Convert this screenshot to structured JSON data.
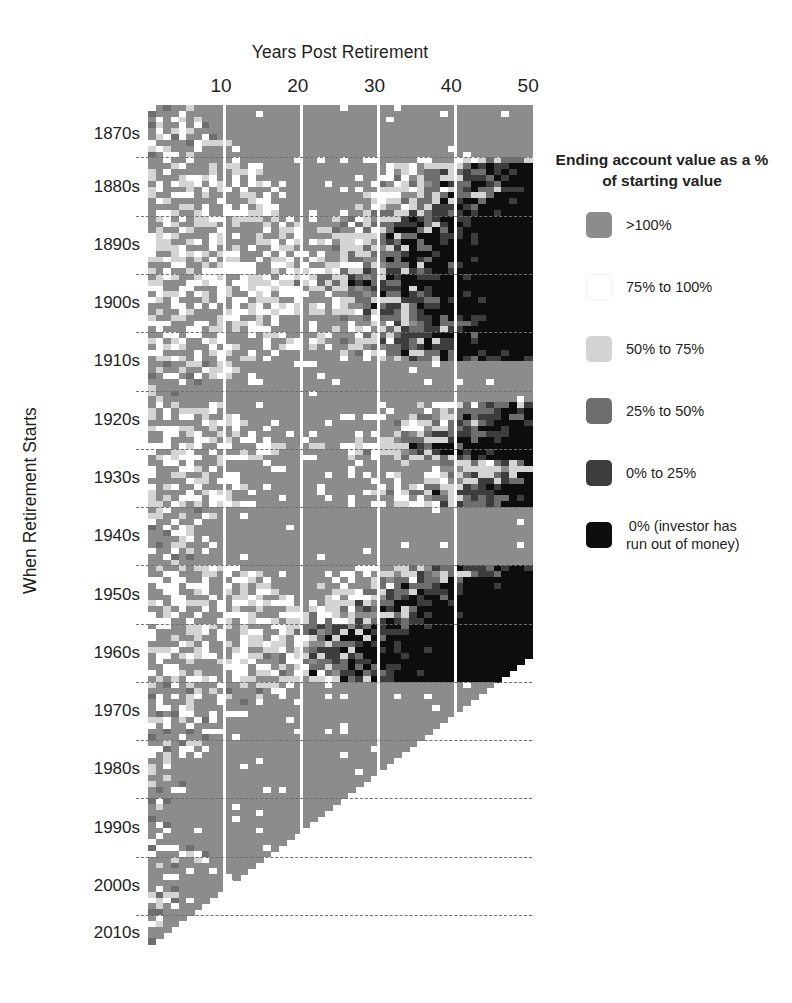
{
  "chart_data": {
    "type": "heatmap",
    "title": "",
    "xlabel": "Years Post Retirement",
    "ylabel": "When Retirement Starts",
    "xticks": [
      10,
      20,
      30,
      40,
      50
    ],
    "xlim": [
      1,
      50
    ],
    "ylim": [
      "1871",
      "2015"
    ],
    "grid": "vertical white separators every 10 years; horizontal dashed separators every decade",
    "legend_position": "right",
    "x_values_label": "Years post retirement (1 to 50)",
    "y_values_label": "Retirement start year (1871 to 2015), grouped by decade",
    "colors": {
      "gt100": "#8c8c8c",
      "p75_100": "#ffffff",
      "p50_75": "#d4d4d4",
      "p25_50": "#6e6e6e",
      "p0_25": "#3d3d3d",
      "zero": "#0d0d0d",
      "nodata": "#ffffff"
    },
    "bins": [
      {
        "key": "gt100",
        "label": ">100%",
        "color": "#8c8c8c"
      },
      {
        "key": "p75_100",
        "label": "75% to 100%",
        "color": "#ffffff"
      },
      {
        "key": "p50_75",
        "label": "50% to 75%",
        "color": "#d4d4d4"
      },
      {
        "key": "p25_50",
        "label": "25% to 50%",
        "color": "#6e6e6e"
      },
      {
        "key": "p0_25",
        "label": "0% to 25%",
        "color": "#3d3d3d"
      },
      {
        "key": "zero",
        "label": "0% (investor has\nrun out of money)",
        "color": "#0d0d0d"
      }
    ],
    "decades": [
      {
        "label": "1870s",
        "start": 1871
      },
      {
        "label": "1880s",
        "start": 1880
      },
      {
        "label": "1890s",
        "start": 1890
      },
      {
        "label": "1900s",
        "start": 1900
      },
      {
        "label": "1910s",
        "start": 1910
      },
      {
        "label": "1920s",
        "start": 1920
      },
      {
        "label": "1930s",
        "start": 1930
      },
      {
        "label": "1940s",
        "start": 1940
      },
      {
        "label": "1950s",
        "start": 1950
      },
      {
        "label": "1960s",
        "start": 1960
      },
      {
        "label": "1970s",
        "start": 1970
      },
      {
        "label": "1980s",
        "start": 1980
      },
      {
        "label": "1990s",
        "start": 1990
      },
      {
        "label": "2000s",
        "start": 2000
      },
      {
        "label": "2010s",
        "start": 2010
      }
    ],
    "row_start_year": 1871,
    "row_end_year": 2015,
    "data_cutoff_year": 2015,
    "note": "Cells right of the diagonal are blank because the retirement period has not yet elapsed.",
    "row_profiles": [
      {
        "year": 1871,
        "onset": 99,
        "noise": 3,
        "early": 6
      },
      {
        "year": 1872,
        "onset": 99,
        "noise": 3,
        "early": 5
      },
      {
        "year": 1873,
        "onset": 99,
        "noise": 4,
        "early": 9
      },
      {
        "year": 1874,
        "onset": 99,
        "noise": 4,
        "early": 8
      },
      {
        "year": 1875,
        "onset": 99,
        "noise": 4,
        "early": 7
      },
      {
        "year": 1876,
        "onset": 99,
        "noise": 4,
        "early": 10
      },
      {
        "year": 1877,
        "onset": 99,
        "noise": 4,
        "early": 11
      },
      {
        "year": 1878,
        "onset": 99,
        "noise": 3,
        "early": 8
      },
      {
        "year": 1879,
        "onset": 99,
        "noise": 3,
        "early": 6
      },
      {
        "year": 1880,
        "onset": 46,
        "noise": 5,
        "early": 12
      },
      {
        "year": 1881,
        "onset": 40,
        "noise": 5,
        "early": 14
      },
      {
        "year": 1882,
        "onset": 38,
        "noise": 5,
        "early": 15
      },
      {
        "year": 1883,
        "onset": 37,
        "noise": 5,
        "early": 16
      },
      {
        "year": 1884,
        "onset": 38,
        "noise": 5,
        "early": 15
      },
      {
        "year": 1885,
        "onset": 40,
        "noise": 5,
        "early": 13
      },
      {
        "year": 1886,
        "onset": 39,
        "noise": 5,
        "early": 14
      },
      {
        "year": 1887,
        "onset": 37,
        "noise": 5,
        "early": 16
      },
      {
        "year": 1888,
        "onset": 36,
        "noise": 5,
        "early": 17
      },
      {
        "year": 1889,
        "onset": 35,
        "noise": 5,
        "early": 18
      },
      {
        "year": 1890,
        "onset": 33,
        "noise": 6,
        "early": 19
      },
      {
        "year": 1891,
        "onset": 32,
        "noise": 6,
        "early": 20
      },
      {
        "year": 1892,
        "onset": 31,
        "noise": 6,
        "early": 20
      },
      {
        "year": 1893,
        "onset": 30,
        "noise": 6,
        "early": 21
      },
      {
        "year": 1894,
        "onset": 31,
        "noise": 6,
        "early": 20
      },
      {
        "year": 1895,
        "onset": 30,
        "noise": 6,
        "early": 21
      },
      {
        "year": 1896,
        "onset": 29,
        "noise": 6,
        "early": 21
      },
      {
        "year": 1897,
        "onset": 30,
        "noise": 6,
        "early": 20
      },
      {
        "year": 1898,
        "onset": 31,
        "noise": 6,
        "early": 19
      },
      {
        "year": 1899,
        "onset": 29,
        "noise": 6,
        "early": 20
      },
      {
        "year": 1900,
        "onset": 28,
        "noise": 6,
        "early": 21
      },
      {
        "year": 1901,
        "onset": 27,
        "noise": 6,
        "early": 22
      },
      {
        "year": 1902,
        "onset": 28,
        "noise": 6,
        "early": 21
      },
      {
        "year": 1903,
        "onset": 29,
        "noise": 6,
        "early": 20
      },
      {
        "year": 1904,
        "onset": 31,
        "noise": 6,
        "early": 19
      },
      {
        "year": 1905,
        "onset": 30,
        "noise": 6,
        "early": 20
      },
      {
        "year": 1906,
        "onset": 29,
        "noise": 6,
        "early": 21
      },
      {
        "year": 1907,
        "onset": 32,
        "noise": 6,
        "early": 18
      },
      {
        "year": 1908,
        "onset": 35,
        "noise": 6,
        "early": 16
      },
      {
        "year": 1909,
        "onset": 34,
        "noise": 6,
        "early": 17
      },
      {
        "year": 1910,
        "onset": 33,
        "noise": 6,
        "early": 18
      },
      {
        "year": 1911,
        "onset": 32,
        "noise": 6,
        "early": 19
      },
      {
        "year": 1912,
        "onset": 31,
        "noise": 6,
        "early": 20
      },
      {
        "year": 1913,
        "onset": 33,
        "noise": 6,
        "early": 18
      },
      {
        "year": 1914,
        "onset": 37,
        "noise": 5,
        "early": 15
      },
      {
        "year": 1915,
        "onset": 99,
        "noise": 4,
        "early": 11
      },
      {
        "year": 1916,
        "onset": 99,
        "noise": 4,
        "early": 12
      },
      {
        "year": 1917,
        "onset": 99,
        "noise": 4,
        "early": 13
      },
      {
        "year": 1918,
        "onset": 99,
        "noise": 3,
        "early": 9
      },
      {
        "year": 1919,
        "onset": 99,
        "noise": 3,
        "early": 8
      },
      {
        "year": 1920,
        "onset": 99,
        "noise": 3,
        "early": 6
      },
      {
        "year": 1921,
        "onset": 99,
        "noise": 3,
        "early": 5
      },
      {
        "year": 1922,
        "onset": 44,
        "noise": 5,
        "early": 10
      },
      {
        "year": 1923,
        "onset": 42,
        "noise": 5,
        "early": 11
      },
      {
        "year": 1924,
        "onset": 41,
        "noise": 5,
        "early": 12
      },
      {
        "year": 1925,
        "onset": 40,
        "noise": 5,
        "early": 13
      },
      {
        "year": 1926,
        "onset": 39,
        "noise": 5,
        "early": 14
      },
      {
        "year": 1927,
        "onset": 38,
        "noise": 5,
        "early": 15
      },
      {
        "year": 1928,
        "onset": 36,
        "noise": 5,
        "early": 16
      },
      {
        "year": 1929,
        "onset": 34,
        "noise": 6,
        "early": 18
      },
      {
        "year": 1930,
        "onset": 36,
        "noise": 6,
        "early": 17
      },
      {
        "year": 1931,
        "onset": 38,
        "noise": 5,
        "early": 15
      },
      {
        "year": 1932,
        "onset": 45,
        "noise": 5,
        "early": 11
      },
      {
        "year": 1933,
        "onset": 48,
        "noise": 5,
        "early": 10
      },
      {
        "year": 1934,
        "onset": 44,
        "noise": 5,
        "early": 12
      },
      {
        "year": 1935,
        "onset": 43,
        "noise": 5,
        "early": 12
      },
      {
        "year": 1936,
        "onset": 40,
        "noise": 5,
        "early": 14
      },
      {
        "year": 1937,
        "onset": 37,
        "noise": 6,
        "early": 16
      },
      {
        "year": 1938,
        "onset": 42,
        "noise": 5,
        "early": 13
      },
      {
        "year": 1939,
        "onset": 41,
        "noise": 5,
        "early": 13
      },
      {
        "year": 1940,
        "onset": 99,
        "noise": 4,
        "early": 10
      },
      {
        "year": 1941,
        "onset": 99,
        "noise": 4,
        "early": 11
      },
      {
        "year": 1942,
        "onset": 99,
        "noise": 3,
        "early": 7
      },
      {
        "year": 1943,
        "onset": 99,
        "noise": 3,
        "early": 6
      },
      {
        "year": 1944,
        "onset": 99,
        "noise": 3,
        "early": 6
      },
      {
        "year": 1945,
        "onset": 99,
        "noise": 3,
        "early": 7
      },
      {
        "year": 1946,
        "onset": 99,
        "noise": 4,
        "early": 9
      },
      {
        "year": 1947,
        "onset": 99,
        "noise": 3,
        "early": 7
      },
      {
        "year": 1948,
        "onset": 99,
        "noise": 3,
        "early": 6
      },
      {
        "year": 1949,
        "onset": 99,
        "noise": 3,
        "early": 5
      },
      {
        "year": 1950,
        "onset": 38,
        "noise": 5,
        "early": 14
      },
      {
        "year": 1951,
        "onset": 37,
        "noise": 5,
        "early": 15
      },
      {
        "year": 1952,
        "onset": 35,
        "noise": 6,
        "early": 16
      },
      {
        "year": 1953,
        "onset": 34,
        "noise": 6,
        "early": 17
      },
      {
        "year": 1954,
        "onset": 33,
        "noise": 6,
        "early": 17
      },
      {
        "year": 1955,
        "onset": 31,
        "noise": 6,
        "early": 19
      },
      {
        "year": 1956,
        "onset": 29,
        "noise": 6,
        "early": 20
      },
      {
        "year": 1957,
        "onset": 28,
        "noise": 6,
        "early": 21
      },
      {
        "year": 1958,
        "onset": 29,
        "noise": 6,
        "early": 20
      },
      {
        "year": 1959,
        "onset": 27,
        "noise": 7,
        "early": 21
      },
      {
        "year": 1960,
        "onset": 26,
        "noise": 7,
        "early": 22
      },
      {
        "year": 1961,
        "onset": 25,
        "noise": 7,
        "early": 22
      },
      {
        "year": 1962,
        "onset": 24,
        "noise": 7,
        "early": 23
      },
      {
        "year": 1963,
        "onset": 24,
        "noise": 7,
        "early": 23
      },
      {
        "year": 1964,
        "onset": 23,
        "noise": 7,
        "early": 23
      },
      {
        "year": 1965,
        "onset": 22,
        "noise": 7,
        "early": 21
      },
      {
        "year": 1966,
        "onset": 23,
        "noise": 7,
        "early": 21
      },
      {
        "year": 1967,
        "onset": 24,
        "noise": 7,
        "early": 22
      },
      {
        "year": 1968,
        "onset": 23,
        "noise": 7,
        "early": 21
      },
      {
        "year": 1969,
        "onset": 25,
        "noise": 7,
        "early": 22
      },
      {
        "year": 1970,
        "onset": 99,
        "noise": 6,
        "early": 20
      },
      {
        "year": 1971,
        "onset": 99,
        "noise": 6,
        "early": 19
      },
      {
        "year": 1972,
        "onset": 99,
        "noise": 6,
        "early": 18
      },
      {
        "year": 1973,
        "onset": 99,
        "noise": 6,
        "early": 19
      },
      {
        "year": 1974,
        "onset": 99,
        "noise": 5,
        "early": 14
      },
      {
        "year": 1975,
        "onset": 99,
        "noise": 4,
        "early": 10
      },
      {
        "year": 1976,
        "onset": 99,
        "noise": 4,
        "early": 10
      },
      {
        "year": 1977,
        "onset": 99,
        "noise": 4,
        "early": 12
      },
      {
        "year": 1978,
        "onset": 99,
        "noise": 4,
        "early": 10
      },
      {
        "year": 1979,
        "onset": 99,
        "noise": 3,
        "early": 8
      },
      {
        "year": 1980,
        "onset": 99,
        "noise": 3,
        "early": 7
      },
      {
        "year": 1981,
        "onset": 99,
        "noise": 4,
        "early": 9
      },
      {
        "year": 1982,
        "onset": 99,
        "noise": 3,
        "early": 5
      },
      {
        "year": 1983,
        "onset": 99,
        "noise": 3,
        "early": 5
      },
      {
        "year": 1984,
        "onset": 99,
        "noise": 3,
        "early": 5
      },
      {
        "year": 1985,
        "onset": 99,
        "noise": 2,
        "early": 4
      },
      {
        "year": 1986,
        "onset": 99,
        "noise": 2,
        "early": 4
      },
      {
        "year": 1987,
        "onset": 99,
        "noise": 3,
        "early": 6
      },
      {
        "year": 1988,
        "onset": 99,
        "noise": 2,
        "early": 4
      },
      {
        "year": 1989,
        "onset": 99,
        "noise": 2,
        "early": 3
      },
      {
        "year": 1990,
        "onset": 99,
        "noise": 2,
        "early": 4
      },
      {
        "year": 1991,
        "onset": 99,
        "noise": 2,
        "early": 3
      },
      {
        "year": 1992,
        "onset": 99,
        "noise": 2,
        "early": 3
      },
      {
        "year": 1993,
        "onset": 99,
        "noise": 2,
        "early": 3
      },
      {
        "year": 1994,
        "onset": 99,
        "noise": 2,
        "early": 3
      },
      {
        "year": 1995,
        "onset": 99,
        "noise": 2,
        "early": 3
      },
      {
        "year": 1996,
        "onset": 99,
        "noise": 2,
        "early": 3
      },
      {
        "year": 1997,
        "onset": 99,
        "noise": 2,
        "early": 4
      },
      {
        "year": 1998,
        "onset": 99,
        "noise": 3,
        "early": 6
      },
      {
        "year": 1999,
        "onset": 99,
        "noise": 3,
        "early": 8
      },
      {
        "year": 2000,
        "onset": 99,
        "noise": 3,
        "early": 9
      },
      {
        "year": 2001,
        "onset": 99,
        "noise": 3,
        "early": 8
      },
      {
        "year": 2002,
        "onset": 99,
        "noise": 2,
        "early": 5
      },
      {
        "year": 2003,
        "onset": 99,
        "noise": 2,
        "early": 3
      },
      {
        "year": 2004,
        "onset": 99,
        "noise": 2,
        "early": 3
      },
      {
        "year": 2005,
        "onset": 99,
        "noise": 2,
        "early": 4
      },
      {
        "year": 2006,
        "onset": 99,
        "noise": 2,
        "early": 4
      },
      {
        "year": 2007,
        "onset": 99,
        "noise": 2,
        "early": 5
      },
      {
        "year": 2008,
        "onset": 99,
        "noise": 2,
        "early": 4
      },
      {
        "year": 2009,
        "onset": 99,
        "noise": 1,
        "early": 2
      },
      {
        "year": 2010,
        "onset": 99,
        "noise": 1,
        "early": 2
      },
      {
        "year": 2011,
        "onset": 99,
        "noise": 1,
        "early": 2
      },
      {
        "year": 2012,
        "onset": 99,
        "noise": 1,
        "early": 2
      },
      {
        "year": 2013,
        "onset": 99,
        "noise": 1,
        "early": 1
      },
      {
        "year": 2014,
        "onset": 99,
        "noise": 1,
        "early": 1
      },
      {
        "year": 2015,
        "onset": 99,
        "noise": 1,
        "early": 1
      }
    ]
  },
  "legend": {
    "title": "Ending account value as a % of starting value"
  }
}
